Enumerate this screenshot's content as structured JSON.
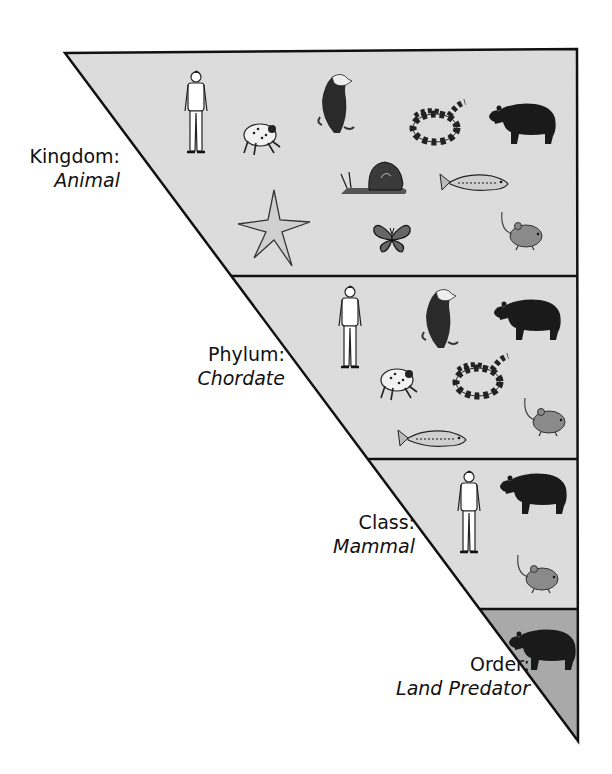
{
  "diagram": {
    "type": "taxonomy-pyramid",
    "colors": {
      "band_fill": "#dcdcdc",
      "order_fill": "#a9a9a9",
      "outline": "#111111"
    },
    "levels": [
      {
        "rank": "Kingdom:",
        "taxon": "Animal",
        "organisms": [
          "human",
          "frog",
          "eagle",
          "snake",
          "bear",
          "snail",
          "fish",
          "starfish",
          "butterfly",
          "mouse"
        ]
      },
      {
        "rank": "Phylum:",
        "taxon": "Chordate",
        "organisms": [
          "human",
          "eagle",
          "bear",
          "frog",
          "snake",
          "mouse",
          "fish"
        ]
      },
      {
        "rank": "Class:",
        "taxon": "Mammal",
        "organisms": [
          "human",
          "bear",
          "mouse"
        ]
      },
      {
        "rank": "Order:",
        "taxon": "Land Predator",
        "organisms": [
          "bear"
        ]
      }
    ]
  }
}
